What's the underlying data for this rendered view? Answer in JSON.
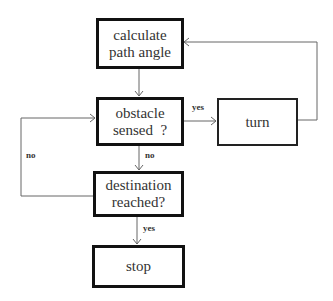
{
  "diagram": {
    "nodes": [
      {
        "id": "calc",
        "label": "calculate path angle"
      },
      {
        "id": "obstacle",
        "label": "obstacle sensed  ?"
      },
      {
        "id": "turn",
        "label": "turn"
      },
      {
        "id": "dest",
        "label": "destination reached?"
      },
      {
        "id": "stop",
        "label": "stop"
      }
    ],
    "edges": [
      {
        "from": "calc",
        "to": "obstacle",
        "label": ""
      },
      {
        "from": "obstacle",
        "to": "turn",
        "label": "yes"
      },
      {
        "from": "turn",
        "to": "calc",
        "label": ""
      },
      {
        "from": "obstacle",
        "to": "dest",
        "label": "no"
      },
      {
        "from": "dest",
        "to": "obstacle",
        "label": "no"
      },
      {
        "from": "dest",
        "to": "stop",
        "label": "yes"
      }
    ]
  },
  "labels": {
    "calc_line1": "calculate",
    "calc_line2": "path angle",
    "obstacle_line1": "obstacle",
    "obstacle_line2": "sensed  ?",
    "turn": "turn",
    "dest_line1": "destination",
    "dest_line2": "reached?",
    "stop": "stop",
    "edge_yes_turn": "yes",
    "edge_no_down": "no",
    "edge_no_loop": "no",
    "edge_yes_stop": "yes"
  }
}
